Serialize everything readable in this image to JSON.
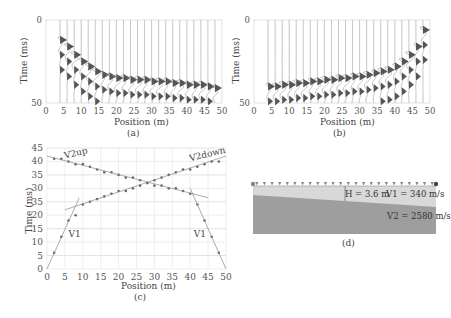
{
  "figure": {
    "panels": [
      {
        "id": "a",
        "caption": "(a)",
        "type": "seismogram",
        "xlabel": "Position (m)",
        "ylabel": "Time (ms)",
        "xticks": [
          "0",
          "5",
          "10",
          "15",
          "20",
          "25",
          "30",
          "35",
          "40",
          "45",
          "50"
        ],
        "yticks": [
          "0",
          "50"
        ],
        "trace_positions_m": [
          4,
          6,
          8,
          10,
          12,
          14,
          16,
          18,
          20,
          22,
          24,
          26,
          28,
          30,
          32,
          34,
          36,
          38,
          40,
          42,
          44,
          46,
          48
        ],
        "first_break_ms": [
          12,
          16,
          21,
          25,
          28,
          31,
          33,
          34,
          35,
          35,
          36,
          36,
          36,
          37,
          37,
          37,
          38,
          38,
          39,
          39,
          39,
          40,
          41
        ]
      },
      {
        "id": "b",
        "caption": "(b)",
        "type": "seismogram",
        "xlabel": "Position (m)",
        "ylabel": "Time (ms)",
        "xticks": [
          "0",
          "5",
          "10",
          "15",
          "20",
          "25",
          "30",
          "35",
          "40",
          "45",
          "50"
        ],
        "yticks": [
          "0",
          "50"
        ],
        "trace_positions_m": [
          4,
          6,
          8,
          10,
          12,
          14,
          16,
          18,
          20,
          22,
          24,
          26,
          28,
          30,
          32,
          34,
          36,
          38,
          40,
          42,
          44,
          46,
          48
        ],
        "first_break_ms": [
          40,
          40,
          39,
          39,
          38,
          38,
          37,
          37,
          36,
          36,
          35,
          35,
          34,
          34,
          33,
          32,
          31,
          30,
          28,
          25,
          21,
          16,
          6
        ]
      },
      {
        "id": "c",
        "caption": "(c)",
        "type": "scatter",
        "xlabel": "Position (m)",
        "ylabel": "Time (ms)",
        "xticks": [
          "0",
          "5",
          "10",
          "15",
          "20",
          "25",
          "30",
          "35",
          "40",
          "45",
          "50"
        ],
        "yticks": [
          "0",
          "5",
          "10",
          "15",
          "20",
          "25",
          "30",
          "35",
          "40",
          "45"
        ],
        "ytick_labels_as_shown": [
          "0",
          "5",
          "10",
          "15",
          "20",
          "35",
          "30",
          "35",
          "40",
          "45"
        ],
        "annotations": [
          "V2up",
          "V2down",
          "V1",
          "V1"
        ]
      },
      {
        "id": "d",
        "caption": "(d)",
        "type": "model",
        "labels": {
          "thickness": "H = 3.6 m",
          "v1": "V1 = 340 m/s",
          "v2": "V2 = 2580 m/s"
        },
        "geophone_count": 24,
        "colors": {
          "layer1": "#d8d8d8",
          "layer2": "#9e9e9e",
          "geophone": "#888888"
        }
      }
    ]
  },
  "chart_data": [
    {
      "type": "line",
      "title": "(a) Forward-shot seismogram",
      "xlabel": "Position (m)",
      "ylabel": "Time (ms)",
      "xlim": [
        0,
        50
      ],
      "ylim": [
        50,
        0
      ],
      "x": [
        4,
        6,
        8,
        10,
        12,
        14,
        16,
        18,
        20,
        22,
        24,
        26,
        28,
        30,
        32,
        34,
        36,
        38,
        40,
        42,
        44,
        46,
        48
      ],
      "series": [
        {
          "name": "first arrivals",
          "values": [
            12,
            16,
            21,
            25,
            28,
            31,
            33,
            34,
            35,
            35,
            36,
            36,
            36,
            37,
            37,
            37,
            38,
            38,
            39,
            39,
            39,
            40,
            41
          ]
        }
      ]
    },
    {
      "type": "line",
      "title": "(b) Reverse-shot seismogram",
      "xlabel": "Position (m)",
      "ylabel": "Time (ms)",
      "xlim": [
        0,
        50
      ],
      "ylim": [
        50,
        0
      ],
      "x": [
        4,
        6,
        8,
        10,
        12,
        14,
        16,
        18,
        20,
        22,
        24,
        26,
        28,
        30,
        32,
        34,
        36,
        38,
        40,
        42,
        44,
        46,
        48
      ],
      "series": [
        {
          "name": "first arrivals",
          "values": [
            40,
            40,
            39,
            39,
            38,
            38,
            37,
            37,
            36,
            36,
            35,
            35,
            34,
            34,
            33,
            32,
            31,
            30,
            28,
            25,
            21,
            16,
            6
          ]
        }
      ]
    },
    {
      "type": "scatter",
      "title": "(c) Travel-time curves",
      "xlabel": "Position (m)",
      "ylabel": "Time (ms)",
      "xlim": [
        0,
        50
      ],
      "ylim": [
        0,
        45
      ],
      "grid": true,
      "series": [
        {
          "name": "forward picks",
          "x": [
            2,
            4,
            6,
            8,
            10,
            12,
            14,
            16,
            18,
            20,
            22,
            24,
            26,
            28,
            30,
            32,
            34,
            36,
            38,
            40,
            42,
            44,
            46,
            48
          ],
          "values": [
            6,
            12,
            18,
            20,
            24,
            25,
            26,
            27,
            28,
            29,
            29,
            30,
            31,
            32,
            33,
            34,
            35,
            36,
            37,
            37,
            38,
            39,
            40,
            40
          ]
        },
        {
          "name": "reverse picks",
          "x": [
            2,
            4,
            6,
            8,
            10,
            12,
            14,
            16,
            18,
            20,
            22,
            24,
            26,
            28,
            30,
            32,
            34,
            36,
            38,
            40,
            42,
            44,
            46,
            48
          ],
          "values": [
            41,
            41,
            40,
            39,
            39,
            38,
            37,
            36,
            36,
            35,
            34,
            34,
            33,
            32,
            31,
            31,
            30,
            30,
            29,
            28,
            24,
            18,
            12,
            6
          ]
        },
        {
          "name": "V1 (forward)",
          "x": [
            0,
            9
          ],
          "values": [
            0,
            26.5
          ]
        },
        {
          "name": "V2down",
          "x": [
            5,
            50
          ],
          "values": [
            22,
            42
          ]
        },
        {
          "name": "V2up",
          "x": [
            0,
            45
          ],
          "values": [
            42,
            26.5
          ]
        },
        {
          "name": "V1 (reverse)",
          "x": [
            40,
            50
          ],
          "values": [
            30,
            0
          ]
        }
      ],
      "annotations": [
        {
          "text": "V2up",
          "x": 5,
          "y": 41
        },
        {
          "text": "V2down",
          "x": 40,
          "y": 40
        },
        {
          "text": "V1",
          "x": 6,
          "y": 12
        },
        {
          "text": "V1",
          "x": 41,
          "y": 12
        }
      ]
    },
    {
      "type": "diagram",
      "title": "(d) Two-layer model",
      "labels": [
        "H = 3.6 m",
        "V1 = 340 m/s",
        "V2 = 2580 m/s"
      ]
    }
  ]
}
